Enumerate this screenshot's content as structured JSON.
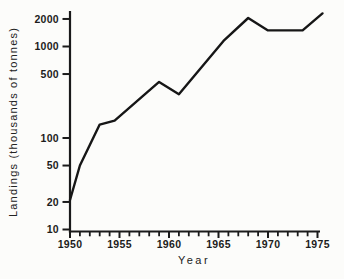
{
  "figure": {
    "background": "#fcfcfa",
    "ink": "#1a1a1a"
  },
  "chart_data": {
    "type": "line",
    "title": "",
    "xlabel": "Year",
    "ylabel": "Landings (thousands of tonnes)",
    "x_scale": "linear",
    "y_scale": "log",
    "xlim": [
      1950,
      1975
    ],
    "ylim": [
      10,
      2500
    ],
    "grid": false,
    "legend": null,
    "x_major_ticks": [
      {
        "value": 1950,
        "label": "1950"
      },
      {
        "value": 1955,
        "label": "1955"
      },
      {
        "value": 1960,
        "label": "1960"
      },
      {
        "value": 1965,
        "label": "1965"
      },
      {
        "value": 1970,
        "label": "1970"
      },
      {
        "value": 1975,
        "label": "1975"
      }
    ],
    "x_minor_tick_step_years": 1,
    "y_ticks": [
      {
        "value": 2000,
        "label": "2000"
      },
      {
        "value": 1000,
        "label": "1000"
      },
      {
        "value": 500,
        "label": "500"
      },
      {
        "value": 100,
        "label": "100"
      },
      {
        "value": 50,
        "label": "50"
      },
      {
        "value": 20,
        "label": "20"
      },
      {
        "value": 10,
        "label": "10"
      }
    ],
    "series": [
      {
        "name": "landings",
        "color": "#161616",
        "points": [
          {
            "year": 1950,
            "value": 21
          },
          {
            "year": 1951,
            "value": 50
          },
          {
            "year": 1953,
            "value": 140
          },
          {
            "year": 1954.5,
            "value": 155
          },
          {
            "year": 1959,
            "value": 410
          },
          {
            "year": 1961,
            "value": 300
          },
          {
            "year": 1965.5,
            "value": 1150
          },
          {
            "year": 1968,
            "value": 2050
          },
          {
            "year": 1970,
            "value": 1500
          },
          {
            "year": 1973.5,
            "value": 1500
          },
          {
            "year": 1975.5,
            "value": 2300
          }
        ]
      }
    ]
  }
}
